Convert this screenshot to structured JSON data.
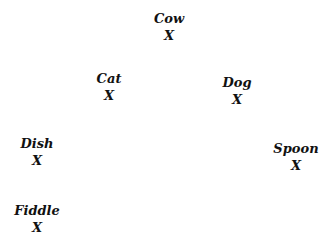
{
  "nodes": [
    {
      "label": "Cow",
      "marker": "X",
      "x": 169,
      "y": 10
    },
    {
      "label": "Cat",
      "marker": "X",
      "x": 109,
      "y": 70
    },
    {
      "label": "Dog",
      "marker": "X",
      "x": 237,
      "y": 74
    },
    {
      "label": "Dish",
      "marker": "X",
      "x": 37,
      "y": 135
    },
    {
      "label": "Spoon",
      "marker": "X",
      "x": 296,
      "y": 140
    },
    {
      "label": "Fiddle",
      "marker": "X",
      "x": 37,
      "y": 202
    }
  ]
}
